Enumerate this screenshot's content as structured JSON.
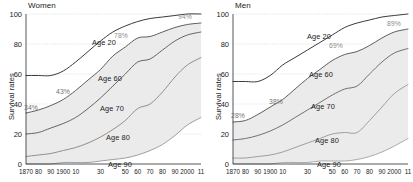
{
  "chart_data": {
    "type": "line",
    "title": "",
    "xlabel": "",
    "ylabel": "Survival rates",
    "ylim": [
      0,
      100
    ],
    "xlim": [
      1870,
      2011
    ],
    "grid": true,
    "legend_position": "inline-labels",
    "panels": [
      {
        "name": "Women",
        "label": "Women",
        "ylabel": "Survival rates",
        "yticks": [
          "0",
          "20",
          "40",
          "60",
          "80",
          "100"
        ],
        "ytick_values": [
          0,
          20,
          40,
          60,
          80,
          100
        ],
        "xticks": [
          "1870",
          "80",
          "90",
          "1900",
          "10",
          "30",
          "50",
          "60",
          "70",
          "80",
          "90",
          "2000",
          "11"
        ],
        "xtick_values": [
          1870,
          1880,
          1890,
          1900,
          1910,
          1930,
          1950,
          1960,
          1970,
          1980,
          1990,
          2000,
          2011
        ],
        "annotations": [
          {
            "text": "34%",
            "x": 1870,
            "y": 34
          },
          {
            "text": "43%",
            "x": 1900,
            "y": 47
          },
          {
            "text": "78%",
            "x": 1950,
            "y": 84
          },
          {
            "text": "94%",
            "x": 2011,
            "y": 95
          }
        ],
        "series": [
          {
            "name": "Age 20",
            "label": "Age 20",
            "color": "#3a3a3a",
            "x": [
              1870,
              1880,
              1890,
              1900,
              1910,
              1920,
              1930,
              1940,
              1950,
              1960,
              1970,
              1980,
              1990,
              2000,
              2011
            ],
            "values": [
              59,
              59,
              59,
              62,
              68,
              75,
              82,
              88,
              92,
              95,
              97,
              98,
              99,
              100,
              100
            ]
          },
          {
            "name": "Age 60",
            "label": "Age 60",
            "color": "#555555",
            "x": [
              1870,
              1880,
              1890,
              1900,
              1910,
              1920,
              1930,
              1940,
              1950,
              1960,
              1970,
              1980,
              1990,
              2000,
              2011
            ],
            "values": [
              34,
              36,
              39,
              43,
              49,
              56,
              63,
              72,
              78,
              84,
              85,
              88,
              91,
              93,
              94
            ]
          },
          {
            "name": "Age 70",
            "label": "Age 70",
            "color": "#5e5e5e",
            "x": [
              1870,
              1880,
              1890,
              1900,
              1910,
              1920,
              1930,
              1940,
              1950,
              1960,
              1970,
              1980,
              1990,
              2000,
              2011
            ],
            "values": [
              20,
              21,
              24,
              27,
              31,
              37,
              44,
              52,
              60,
              68,
              70,
              76,
              82,
              86,
              88
            ]
          },
          {
            "name": "Age 80",
            "label": "Age 80",
            "color": "#8a8a8a",
            "x": [
              1870,
              1880,
              1890,
              1900,
              1910,
              1920,
              1930,
              1940,
              1950,
              1960,
              1970,
              1980,
              1990,
              2000,
              2011
            ],
            "values": [
              5,
              6,
              7,
              9,
              11,
              14,
              18,
              23,
              29,
              37,
              40,
              48,
              58,
              66,
              71
            ]
          },
          {
            "name": "Age 90",
            "label": "Age 90",
            "color": "#9a9a9a",
            "x": [
              1870,
              1880,
              1890,
              1900,
              1910,
              1920,
              1930,
              1940,
              1950,
              1960,
              1970,
              1980,
              1990,
              2000,
              2011
            ],
            "values": [
              0,
              0,
              0,
              1,
              1,
              1,
              2,
              3,
              4,
              6,
              9,
              13,
              19,
              26,
              31
            ]
          }
        ]
      },
      {
        "name": "Men",
        "label": "Men",
        "ylabel": "Survival rates",
        "yticks": [
          "0",
          "20",
          "40",
          "60",
          "80",
          "100"
        ],
        "ytick_values": [
          0,
          20,
          40,
          60,
          80,
          100
        ],
        "xticks": [
          "1870",
          "80",
          "90",
          "1900",
          "10",
          "30",
          "50",
          "60",
          "70",
          "80",
          "90",
          "2000",
          "11"
        ],
        "xtick_values": [
          1870,
          1880,
          1890,
          1900,
          1910,
          1930,
          1950,
          1960,
          1970,
          1980,
          1990,
          2000,
          2011
        ],
        "annotations": [
          {
            "text": "28%",
            "x": 1870,
            "y": 31
          },
          {
            "text": "38%",
            "x": 1900,
            "y": 43
          },
          {
            "text": "69%",
            "x": 1950,
            "y": 75
          },
          {
            "text": "89%",
            "x": 2011,
            "y": 92
          }
        ],
        "series": [
          {
            "name": "Age 20",
            "label": "Age 20",
            "color": "#3a3a3a",
            "x": [
              1870,
              1880,
              1890,
              1900,
              1910,
              1920,
              1930,
              1940,
              1950,
              1960,
              1970,
              1980,
              1990,
              2000,
              2011
            ],
            "values": [
              55,
              55,
              55,
              59,
              66,
              71,
              76,
              81,
              86,
              91,
              94,
              96,
              98,
              99,
              100
            ]
          },
          {
            "name": "Age 60",
            "label": "Age 60",
            "color": "#555555",
            "x": [
              1870,
              1880,
              1890,
              1900,
              1910,
              1920,
              1930,
              1940,
              1950,
              1960,
              1970,
              1980,
              1990,
              2000,
              2011
            ],
            "values": [
              28,
              29,
              33,
              38,
              43,
              50,
              57,
              63,
              69,
              73,
              75,
              79,
              84,
              88,
              90
            ]
          },
          {
            "name": "Age 70",
            "label": "Age 70",
            "color": "#6a6a6a",
            "x": [
              1870,
              1880,
              1890,
              1900,
              1910,
              1920,
              1930,
              1940,
              1950,
              1960,
              1970,
              1980,
              1990,
              2000,
              2011
            ],
            "values": [
              16,
              17,
              19,
              22,
              26,
              31,
              36,
              41,
              46,
              50,
              52,
              60,
              68,
              74,
              77
            ]
          },
          {
            "name": "Age 80",
            "label": "Age 80",
            "color": "#9a9a9a",
            "x": [
              1870,
              1880,
              1890,
              1900,
              1910,
              1920,
              1930,
              1940,
              1950,
              1960,
              1970,
              1980,
              1990,
              2000,
              2011
            ],
            "values": [
              4,
              4,
              5,
              6,
              8,
              11,
              14,
              17,
              20,
              21,
              21,
              29,
              38,
              47,
              53
            ]
          },
          {
            "name": "Age 90",
            "label": "Age 90",
            "color": "#a5a5a5",
            "x": [
              1870,
              1880,
              1890,
              1900,
              1910,
              1920,
              1930,
              1940,
              1950,
              1960,
              1970,
              1980,
              1990,
              2000,
              2011
            ],
            "values": [
              0,
              0,
              0,
              0,
              1,
              1,
              1,
              2,
              2,
              2,
              3,
              5,
              8,
              12,
              17
            ]
          }
        ]
      }
    ]
  }
}
